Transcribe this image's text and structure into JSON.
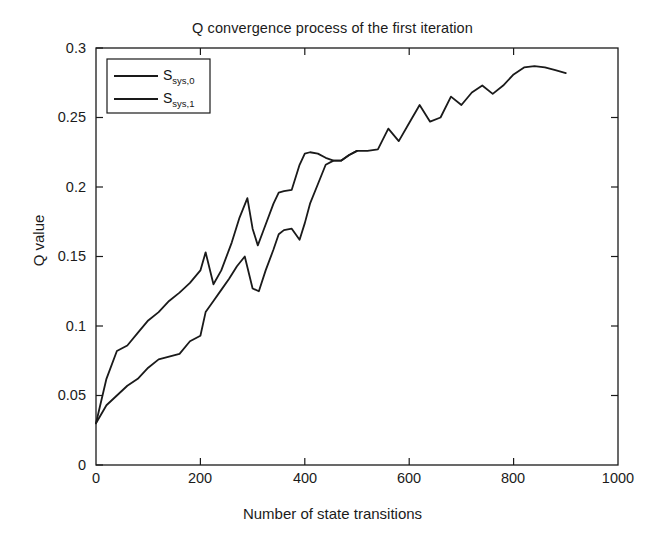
{
  "chart_data": {
    "type": "line",
    "title": "Q convergence process of the first iteration",
    "xlabel": "Number of state transitions",
    "ylabel": "Q value",
    "xlim": [
      0,
      1000
    ],
    "ylim": [
      0,
      0.3
    ],
    "xticks": [
      0,
      200,
      400,
      600,
      800,
      1000
    ],
    "xtick_labels": [
      "0",
      "200",
      "400",
      "600",
      "800",
      "1000"
    ],
    "yticks": [
      0,
      0.05,
      0.1,
      0.15,
      0.2,
      0.25,
      0.3
    ],
    "ytick_labels": [
      "0",
      "0.05",
      "0.1",
      "0.15",
      "0.2",
      "0.25",
      "0.3"
    ],
    "grid": false,
    "legend_position": "upper left",
    "line_color": "#1a1a1a",
    "series": [
      {
        "name": "S_sys,0",
        "label_base": "S",
        "label_sub": "sys,0",
        "x": [
          0,
          20,
          40,
          60,
          80,
          100,
          120,
          140,
          160,
          180,
          200,
          210,
          225,
          240,
          260,
          275,
          290,
          300,
          310,
          320,
          340,
          350,
          360,
          375,
          390,
          400,
          410,
          425,
          440,
          455,
          470,
          485,
          500,
          520,
          540,
          560,
          580,
          600,
          620,
          640,
          660,
          680,
          700,
          720,
          740,
          760,
          780,
          800,
          820,
          840,
          860,
          880,
          900
        ],
        "y": [
          0.03,
          0.062,
          0.082,
          0.086,
          0.095,
          0.104,
          0.11,
          0.118,
          0.124,
          0.131,
          0.14,
          0.153,
          0.13,
          0.14,
          0.16,
          0.178,
          0.192,
          0.17,
          0.158,
          0.168,
          0.188,
          0.196,
          0.197,
          0.198,
          0.216,
          0.224,
          0.225,
          0.224,
          0.221,
          0.219,
          0.219,
          0.223,
          0.226,
          0.226,
          0.227,
          0.242,
          0.233,
          0.246,
          0.259,
          0.247,
          0.25,
          0.265,
          0.259,
          0.268,
          0.273,
          0.267,
          0.273,
          0.281,
          0.286,
          0.287,
          0.286,
          0.284,
          0.282
        ]
      },
      {
        "name": "S_sys,1",
        "label_base": "S",
        "label_sub": "sys,1",
        "x": [
          0,
          20,
          40,
          60,
          80,
          100,
          120,
          140,
          160,
          180,
          200,
          210,
          225,
          240,
          255,
          270,
          285,
          300,
          312,
          325,
          340,
          350,
          360,
          375,
          390,
          400,
          410,
          425,
          440,
          455,
          470,
          485,
          500
        ],
        "y": [
          0.03,
          0.043,
          0.05,
          0.057,
          0.062,
          0.07,
          0.076,
          0.078,
          0.08,
          0.089,
          0.093,
          0.11,
          0.118,
          0.126,
          0.134,
          0.143,
          0.15,
          0.127,
          0.125,
          0.14,
          0.155,
          0.166,
          0.169,
          0.17,
          0.162,
          0.174,
          0.188,
          0.202,
          0.216,
          0.219,
          0.219,
          0.223,
          0.226
        ]
      }
    ]
  },
  "figure": {
    "background": "#ffffff",
    "axis_color": "#1a1a1a"
  }
}
